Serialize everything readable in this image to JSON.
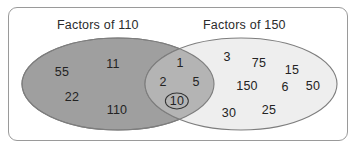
{
  "diagram": {
    "type": "venn",
    "title_left": "Factors of 110",
    "title_right": "Factors of 150",
    "colors": {
      "frame_border": "#9a9a9a",
      "left_fill": "#9f9f9f",
      "right_fill": "#ededed",
      "overlap_fill": "#b4b4b4",
      "ellipse_stroke": "#7d7d7d",
      "text": "#232323",
      "highlight_ring": "#333333",
      "background": "#ffffff"
    },
    "left_only": {
      "label": "Factors of 110 only",
      "values": [
        {
          "text": "55",
          "x": 62,
          "y": 72
        },
        {
          "text": "11",
          "x": 113,
          "y": 64
        },
        {
          "text": "22",
          "x": 72,
          "y": 97
        },
        {
          "text": "110",
          "x": 117,
          "y": 110
        }
      ]
    },
    "intersection": {
      "label": "Common factors of 110 and 150",
      "values": [
        {
          "text": "1",
          "x": 180,
          "y": 63,
          "highlighted": false
        },
        {
          "text": "2",
          "x": 163,
          "y": 82,
          "highlighted": false
        },
        {
          "text": "5",
          "x": 196,
          "y": 82,
          "highlighted": false
        },
        {
          "text": "10",
          "x": 177,
          "y": 101,
          "highlighted": true
        }
      ]
    },
    "right_only": {
      "label": "Factors of 150 only",
      "values": [
        {
          "text": "3",
          "x": 227,
          "y": 57
        },
        {
          "text": "75",
          "x": 259,
          "y": 63
        },
        {
          "text": "15",
          "x": 292,
          "y": 70
        },
        {
          "text": "150",
          "x": 247,
          "y": 86
        },
        {
          "text": "6",
          "x": 285,
          "y": 87
        },
        {
          "text": "50",
          "x": 313,
          "y": 86
        },
        {
          "text": "30",
          "x": 229,
          "y": 113
        },
        {
          "text": "25",
          "x": 269,
          "y": 110
        }
      ]
    }
  }
}
